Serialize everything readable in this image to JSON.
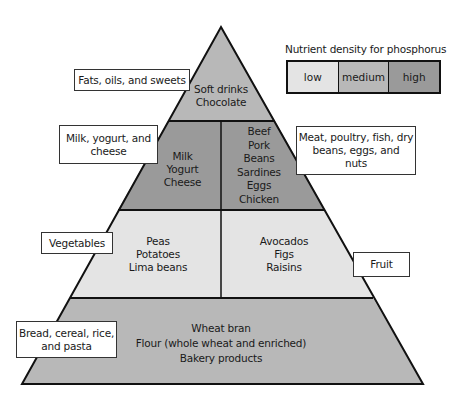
{
  "legend": {
    "title": "Nutrient density for phosphorus",
    "levels": [
      {
        "label": "low",
        "color": "#e4e4e4"
      },
      {
        "label": "medium",
        "color": "#b8b8b8"
      },
      {
        "label": "high",
        "color": "#9a9a9a"
      }
    ]
  },
  "pyramid": {
    "tiers": [
      {
        "group": "Fats, oils, and sweets",
        "sections": [
          {
            "density": "medium",
            "foods": [
              "Soft drinks",
              "Chocolate"
            ]
          }
        ]
      },
      {
        "groups": [
          "Milk, yogurt, and cheese",
          "Meat, poultry, fish, dry beans, eggs, and nuts"
        ],
        "sections": [
          {
            "density": "high",
            "foods": [
              "Milk",
              "Yogurt",
              "Cheese"
            ]
          },
          {
            "density": "high",
            "foods": [
              "Beef",
              "Pork",
              "Beans",
              "Sardines",
              "Eggs",
              "Chicken"
            ]
          }
        ]
      },
      {
        "groups": [
          "Vegetables",
          "Fruit"
        ],
        "sections": [
          {
            "density": "low",
            "foods": [
              "Peas",
              "Potatoes",
              "Lima beans"
            ]
          },
          {
            "density": "low",
            "foods": [
              "Avocados",
              "Figs",
              "Raisins"
            ]
          }
        ]
      },
      {
        "group": "Bread, cereal, rice, and pasta",
        "sections": [
          {
            "density": "medium",
            "foods": [
              "Wheat bran",
              "Flour (whole wheat and enriched)",
              "Bakery products"
            ]
          }
        ]
      }
    ]
  },
  "labels": {
    "fats": {
      "line1": "Fats, oils, and sweets"
    },
    "milk": {
      "line1": "Milk, yogurt, and",
      "line2": "cheese"
    },
    "meat": {
      "line1": "Meat, poultry, fish, dry",
      "line2": "beans, eggs, and",
      "line3": "nuts"
    },
    "vegetables": {
      "line1": "Vegetables"
    },
    "fruit": {
      "line1": "Fruit"
    },
    "bread": {
      "line1": "Bread, cereal, rice,",
      "line2": "and pasta"
    }
  }
}
